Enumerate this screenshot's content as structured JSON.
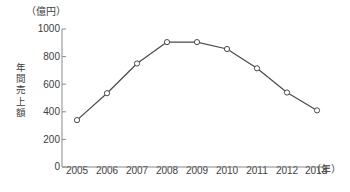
{
  "chart_data": {
    "type": "line",
    "title": "",
    "subtitle": "",
    "xlabel": "（年）",
    "ylabel": "年間売上額",
    "yunit": "（億円）",
    "categories": [
      "2005",
      "2006",
      "2007",
      "2008",
      "2009",
      "2010",
      "2011",
      "2012",
      "2013"
    ],
    "values": [
      340,
      535,
      750,
      905,
      905,
      855,
      715,
      540,
      410
    ],
    "series": [
      {
        "name": "年間売上額",
        "values": [
          340,
          535,
          750,
          905,
          905,
          855,
          715,
          540,
          410
        ]
      }
    ],
    "ylim": [
      0,
      1000
    ],
    "yticks": [
      "0",
      "200",
      "400",
      "600",
      "800",
      "1000"
    ],
    "ytick_values": [
      0,
      200,
      400,
      600,
      800,
      1000
    ],
    "grid": false,
    "legend": "none",
    "marker": "open-circle",
    "line_color": "#4a4a4a",
    "marker_fill": "#ffffff",
    "axis_color": "#8a8a8a",
    "text_color": "#3d3d3d"
  }
}
